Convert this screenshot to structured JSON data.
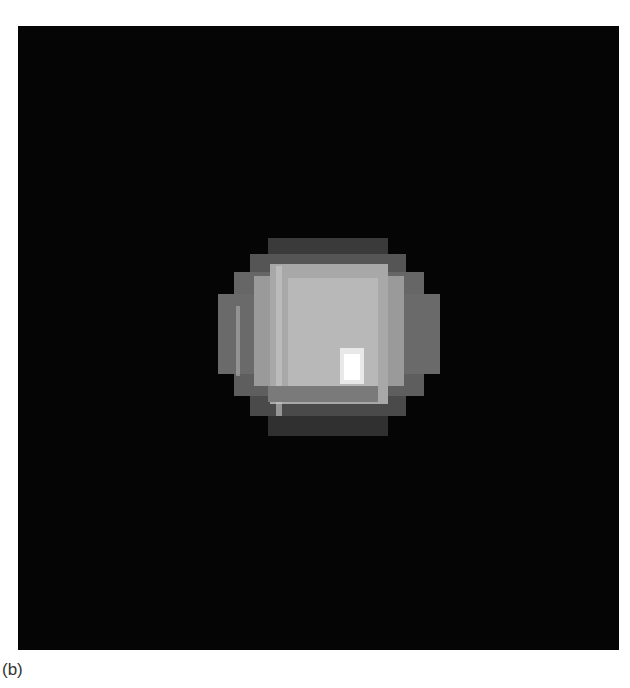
{
  "figure": {
    "panel_label": "(b)",
    "image_description": "Pixelated grayscale image of a bright round object on a black background",
    "colors": {
      "background": "#050505",
      "object_core": "#bdbdbd",
      "highlight": "#ffffff"
    }
  }
}
